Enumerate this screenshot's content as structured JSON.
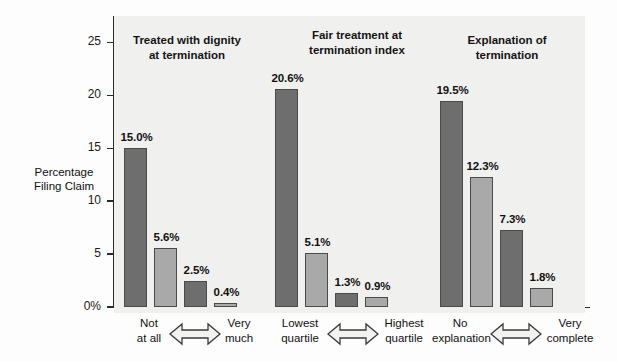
{
  "chart_data": {
    "type": "bar",
    "title": "",
    "xlabel": "",
    "ylabel": "Percentage\nFiling Claim",
    "ylim": [
      0,
      27.5
    ],
    "grid": false,
    "legend": "none",
    "y_ticks": [
      {
        "value": 0,
        "label": "0%"
      },
      {
        "value": 5,
        "label": "5"
      },
      {
        "value": 10,
        "label": "10"
      },
      {
        "value": 15,
        "label": "15"
      },
      {
        "value": 20,
        "label": "20"
      },
      {
        "value": 25,
        "label": "25"
      }
    ],
    "groups": [
      {
        "title": "Treated with dignity\nat termination",
        "scale_low": "Not\nat all",
        "scale_high": "Very\nmuch",
        "categories": [
          "Not at all",
          "",
          "",
          "Very much"
        ],
        "values": [
          15.0,
          5.6,
          2.5,
          0.4
        ],
        "labels": [
          "15.0%",
          "5.6%",
          "2.5%",
          "0.4%"
        ],
        "colors": [
          "#6e6e6e",
          "#a9a9a9",
          "#6e6e6e",
          "#a9a9a9"
        ]
      },
      {
        "title": "Fair treatment at\ntermination index",
        "scale_low": "Lowest\nquartile",
        "scale_high": "Highest\nquartile",
        "categories": [
          "Lowest quartile",
          "",
          "",
          "Highest quartile"
        ],
        "values": [
          20.6,
          5.1,
          1.3,
          0.9
        ],
        "labels": [
          "20.6%",
          "5.1%",
          "1.3%",
          "0.9%"
        ],
        "colors": [
          "#6e6e6e",
          "#a9a9a9",
          "#6e6e6e",
          "#a9a9a9"
        ]
      },
      {
        "title": "Explanation of\ntermination",
        "scale_low": "No\nexplanation",
        "scale_high": "Very\ncomplete",
        "categories": [
          "No explanation",
          "",
          "",
          "Very complete"
        ],
        "values": [
          19.5,
          12.3,
          7.3,
          1.8
        ],
        "labels": [
          "19.5%",
          "12.3%",
          "7.3%",
          "1.8%"
        ],
        "colors": [
          "#6e6e6e",
          "#a9a9a9",
          "#6e6e6e",
          "#a9a9a9"
        ]
      }
    ],
    "colors": {
      "bar_dark": "#6e6e6e",
      "bar_light": "#a9a9a9",
      "bar_outline": "#4a4a4a",
      "plot_background": "#f0f0ee",
      "axis": "#2b2b2b",
      "text": "#111111",
      "arrow_fill": "#f2f2f0",
      "arrow_outline": "#3a3a3a"
    },
    "arrow_icon": "double-headed-horizontal-arrow"
  }
}
